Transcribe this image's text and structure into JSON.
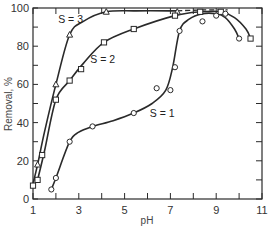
{
  "chart_data": {
    "type": "line",
    "title": "",
    "xlabel": "pH",
    "ylabel": "Removal, %",
    "xlim": [
      1,
      11
    ],
    "ylim": [
      0,
      100
    ],
    "xticks": [
      1,
      3,
      5,
      7,
      9,
      11
    ],
    "xticks_minor": [
      2,
      4,
      6,
      8,
      10
    ],
    "yticks": [
      0,
      20,
      40,
      60,
      80,
      100
    ],
    "yticks_minor": [
      10,
      30,
      50,
      70,
      90
    ],
    "grid": false,
    "legend": "inline labels",
    "series": [
      {
        "name": "S = 3",
        "marker": "triangle",
        "label_pos": [
          2.1,
          92
        ],
        "x": [
          1.2,
          2.0,
          2.6,
          4.2,
          7.3
        ],
        "y": [
          18,
          60,
          86,
          98,
          98
        ],
        "curve_x": [
          1.0,
          1.2,
          1.5,
          2.0,
          2.6,
          3.2,
          4.2,
          5.5,
          7.3
        ],
        "curve_y": [
          8,
          18,
          35,
          60,
          86,
          93,
          98,
          98.5,
          98.5
        ],
        "dashed_x": [
          7.3,
          8.5,
          9.5
        ],
        "dashed_y": [
          98.5,
          99,
          99
        ]
      },
      {
        "name": "S = 2",
        "marker": "square",
        "label_pos": [
          3.5,
          71
        ],
        "x": [
          1.0,
          1.2,
          1.4,
          2.0,
          2.6,
          3.1,
          4.1,
          5.4,
          7.2,
          8.3,
          9.2,
          10.5
        ],
        "y": [
          7,
          10,
          23,
          52,
          62,
          68,
          82,
          89,
          96,
          98,
          98,
          84
        ],
        "curve_x": [
          1.2,
          1.5,
          2.0,
          2.6,
          3.2,
          4.1,
          5.4,
          7.2,
          8.3,
          9.2,
          9.8,
          10.3,
          10.5
        ],
        "curve_y": [
          10,
          25,
          52,
          62,
          71,
          82,
          89,
          96,
          98,
          98,
          95,
          89,
          84
        ]
      },
      {
        "name": "S = 1",
        "marker": "circle",
        "label_pos": [
          6.1,
          43
        ],
        "x": [
          1.8,
          2.0,
          2.6,
          3.6,
          5.4,
          6.4,
          7.0,
          7.2,
          7.4,
          8.4,
          9.0,
          9.4,
          10.0
        ],
        "y": [
          5,
          11,
          30,
          38,
          45,
          58,
          57,
          69,
          88,
          93,
          96,
          97,
          84
        ],
        "curve_x": [
          1.8,
          2.0,
          2.6,
          3.0,
          3.6,
          4.5,
          5.4,
          6.2,
          6.8,
          7.1,
          7.4,
          7.8,
          8.4,
          9.0,
          9.4,
          9.8,
          10.0
        ],
        "curve_y": [
          5,
          11,
          30,
          35,
          38,
          41,
          45,
          50,
          57,
          69,
          88,
          94,
          97,
          97,
          95,
          89,
          84
        ]
      }
    ]
  }
}
